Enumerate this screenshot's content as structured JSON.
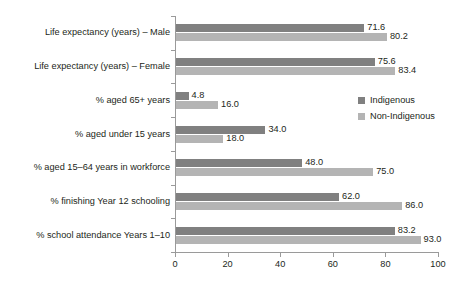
{
  "chart_data": {
    "type": "bar",
    "orientation": "horizontal",
    "title": "",
    "xlabel": "",
    "ylabel": "",
    "xlim": [
      0,
      100
    ],
    "xticks": [
      0,
      20,
      40,
      60,
      80,
      100
    ],
    "grid": false,
    "legend_position": "inside-right",
    "categories": [
      "Life expectancy (years) – Male",
      "Life expectancy (years) – Female",
      "% aged 65+ years",
      "% aged under 15 years",
      "% aged 15–64 years in workforce",
      "% finishing Year 12 schooling",
      "% school attendance Years 1–10"
    ],
    "series": [
      {
        "name": "Indigenous",
        "color": "#808080",
        "values": [
          71.6,
          75.6,
          4.8,
          34.0,
          48.0,
          62.0,
          83.2
        ],
        "labels": [
          "71.6",
          "75.6",
          "4.8",
          "34.0",
          "48.0",
          "62.0",
          "83.2"
        ]
      },
      {
        "name": "Non-Indigenous",
        "color": "#b4b4b4",
        "values": [
          80.2,
          83.4,
          16.0,
          18.0,
          75.0,
          86.0,
          93.0
        ],
        "labels": [
          "80.2",
          "83.4",
          "16.0",
          "18.0",
          "75.0",
          "86.0",
          "93.0"
        ]
      }
    ]
  },
  "axis": {
    "tick_labels": [
      "0",
      "20",
      "40",
      "60",
      "80",
      "100"
    ]
  },
  "legend": {
    "items": [
      {
        "label": "Indigenous",
        "color": "#808080"
      },
      {
        "label": "Non-Indigenous",
        "color": "#b4b4b4"
      }
    ]
  },
  "colors": {
    "indigenous": "#808080",
    "non_indigenous": "#b4b4b4",
    "axis": "#9a9a9a",
    "text": "#231f20",
    "background": "#ffffff"
  }
}
